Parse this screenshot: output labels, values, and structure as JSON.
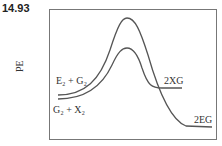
{
  "problem_number": "14.93",
  "y_axis_label": "PE",
  "labels": {
    "upper_reactants": "E₂ + G₂",
    "lower_reactants": "G₂ + X₂",
    "upper_product": "2XG",
    "lower_product": "2EG"
  },
  "colors": {
    "curve": "#555555",
    "frame": "#777777"
  }
}
